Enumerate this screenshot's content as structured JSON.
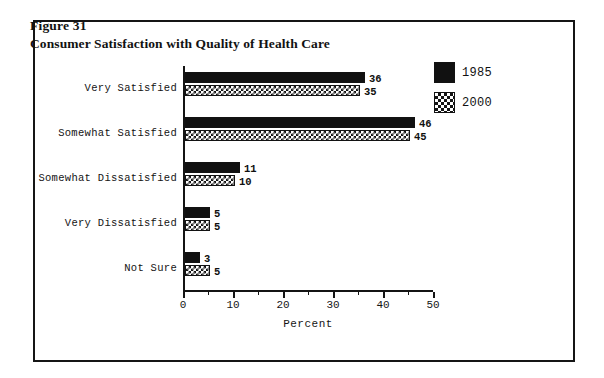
{
  "figure": {
    "number": "Figure 31",
    "title": "Consumer Satisfaction with Quality of Health Care"
  },
  "chart_data": {
    "type": "bar",
    "orientation": "horizontal",
    "title": "Consumer Satisfaction with Quality of Health Care",
    "xlabel": "Percent",
    "ylabel": "",
    "xlim": [
      0,
      50
    ],
    "xticks": [
      0,
      10,
      20,
      30,
      40,
      50
    ],
    "xtick_labels": [
      "0",
      "10",
      "20",
      "30",
      "40",
      "50"
    ],
    "minor_tick_interval": 5,
    "grid": false,
    "legend_position": "top-right",
    "categories": [
      "Very Satisfied",
      "Somewhat Satisfied",
      "Somewhat Dissatisfied",
      "Very Dissatisfied",
      "Not Sure"
    ],
    "series": [
      {
        "name": "1985",
        "fill": "solid-black",
        "color": "#111111",
        "values": [
          36,
          46,
          11,
          5,
          3
        ]
      },
      {
        "name": "2000",
        "fill": "cross-hatch",
        "color": "#141414",
        "values": [
          35,
          45,
          10,
          5,
          5
        ]
      }
    ]
  },
  "legend": {
    "items": [
      {
        "label": "1985",
        "fill": "solid-black"
      },
      {
        "label": "2000",
        "fill": "cross-hatch"
      }
    ]
  }
}
